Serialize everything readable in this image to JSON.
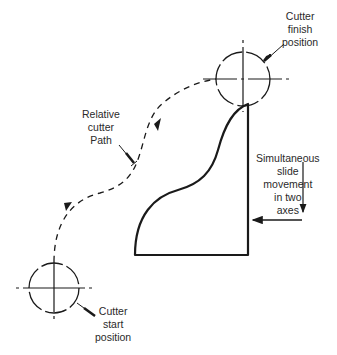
{
  "diagram": {
    "colors": {
      "line": "#1a1a1a",
      "text": "#2a2a2a",
      "background": "#ffffff"
    },
    "labels": {
      "finish": {
        "lines": [
          "Cutter",
          "finish",
          "position"
        ]
      },
      "path": {
        "lines": [
          "Relative",
          "cutter",
          "Path"
        ]
      },
      "slide": {
        "lines": [
          "Simultaneous",
          "slide",
          "movement",
          "in two",
          "axes"
        ]
      },
      "start": {
        "lines": [
          "Cutter",
          "start",
          "position"
        ]
      }
    },
    "elements": {
      "finish_circle": {
        "cx": 243,
        "cy": 79,
        "r": 27
      },
      "start_circle": {
        "cx": 54,
        "cy": 288,
        "r": 25
      },
      "workpiece": {
        "bottom_left": [
          135,
          255
        ],
        "bottom_right": [
          248,
          255
        ],
        "top_right": [
          248,
          104
        ]
      },
      "axis_arrows": {
        "vertical": "down",
        "horizontal": "left"
      }
    }
  }
}
